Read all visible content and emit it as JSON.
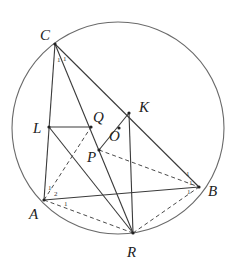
{
  "figure": {
    "type": "geometry-diagram",
    "circle": {
      "cx": 118,
      "cy": 128,
      "r": 106
    },
    "points": {
      "C": {
        "x": 55,
        "y": 44,
        "label": "C",
        "lx": 40,
        "ly": 40
      },
      "L": {
        "x": 49,
        "y": 127,
        "label": "L",
        "lx": 33,
        "ly": 133
      },
      "Q": {
        "x": 91,
        "y": 127,
        "label": "Q",
        "lx": 93,
        "ly": 122
      },
      "K": {
        "x": 129,
        "y": 113,
        "label": "K",
        "lx": 139,
        "ly": 112
      },
      "O": {
        "x": 119,
        "y": 128,
        "label": "O",
        "lx": 109,
        "ly": 141
      },
      "P": {
        "x": 99,
        "y": 150,
        "label": "P",
        "lx": 87,
        "ly": 162
      },
      "A": {
        "x": 44,
        "y": 200,
        "label": "A",
        "lx": 29,
        "ly": 219
      },
      "B": {
        "x": 199,
        "y": 187,
        "label": "B",
        "lx": 208,
        "ly": 196
      },
      "R": {
        "x": 133,
        "y": 233,
        "label": "R",
        "lx": 127,
        "ly": 257
      }
    },
    "solid_segments": [
      [
        "C",
        "A"
      ],
      [
        "C",
        "R"
      ],
      [
        "C",
        "B"
      ],
      [
        "L",
        "Q"
      ],
      [
        "L",
        "R"
      ],
      [
        "K",
        "P"
      ],
      [
        "K",
        "R"
      ],
      [
        "A",
        "B"
      ]
    ],
    "dashed_segments": [
      [
        "A",
        "Q"
      ],
      [
        "A",
        "R"
      ],
      [
        "P",
        "B"
      ],
      [
        "R",
        "B"
      ]
    ],
    "angle_marks": [
      {
        "text": "1",
        "x": 57,
        "y": 62
      },
      {
        "text": "1",
        "x": 63,
        "y": 61
      },
      {
        "text": "1",
        "x": 48,
        "y": 190
      },
      {
        "text": "2",
        "x": 54,
        "y": 196
      },
      {
        "text": "1",
        "x": 64,
        "y": 206
      },
      {
        "text": "1",
        "x": 186,
        "y": 176
      },
      {
        "text": "1",
        "x": 189,
        "y": 185
      },
      {
        "text": "1",
        "x": 187,
        "y": 194
      }
    ]
  }
}
